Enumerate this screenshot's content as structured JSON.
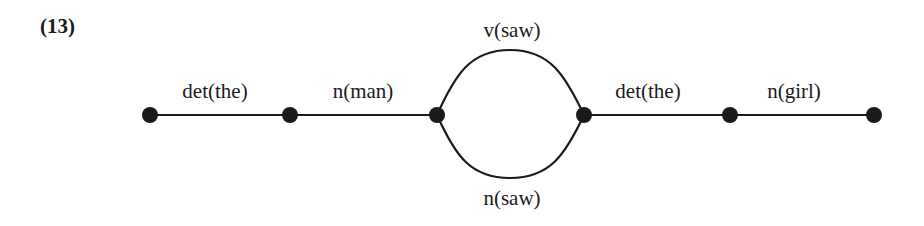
{
  "example_number": "(13)",
  "diagram": {
    "type": "word-lattice",
    "nodes": [
      {
        "id": 1,
        "x": 150,
        "y": 115
      },
      {
        "id": 2,
        "x": 290,
        "y": 115
      },
      {
        "id": 3,
        "x": 437,
        "y": 115
      },
      {
        "id": 4,
        "x": 584,
        "y": 115
      },
      {
        "id": 5,
        "x": 730,
        "y": 115
      },
      {
        "id": 6,
        "x": 874,
        "y": 115
      }
    ],
    "edges": [
      {
        "from": 1,
        "to": 2,
        "label": "det(the)"
      },
      {
        "from": 2,
        "to": 3,
        "label": "n(man)"
      },
      {
        "from": 3,
        "to": 4,
        "label": "v(saw)",
        "shape": "upper-arc"
      },
      {
        "from": 3,
        "to": 4,
        "label": "n(saw)",
        "shape": "lower-arc"
      },
      {
        "from": 4,
        "to": 5,
        "label": "det(the)"
      },
      {
        "from": 5,
        "to": 6,
        "label": "n(girl)"
      }
    ],
    "colors": {
      "ink": "#1a1a1a",
      "background": "#ffffff"
    }
  }
}
